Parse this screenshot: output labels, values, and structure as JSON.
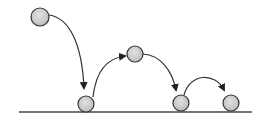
{
  "diagram": {
    "title": "",
    "type": "bouncing-ball-trajectory",
    "colors": {
      "ball_fill": "#cfcfcf",
      "stroke": "#333333",
      "ground": "#444444"
    },
    "ground": {
      "x1": 19,
      "x2": 252,
      "y": 112
    },
    "balls": [
      {
        "id": "ball-1",
        "cx": 40,
        "cy": 17,
        "r": 9
      },
      {
        "id": "ball-2",
        "cx": 86,
        "cy": 104,
        "r": 8
      },
      {
        "id": "ball-3",
        "cx": 135,
        "cy": 54,
        "r": 8
      },
      {
        "id": "ball-4",
        "cx": 181,
        "cy": 103,
        "r": 8
      },
      {
        "id": "ball-5",
        "cx": 231,
        "cy": 103,
        "r": 8
      }
    ],
    "arcs": [
      {
        "id": "arc-1",
        "d": "M49,15 C70,18 82,45 84,88",
        "from": "ball-1",
        "to": "ball-2"
      },
      {
        "id": "arc-2",
        "d": "M93,97 C96,70 108,58 125,56",
        "from": "ball-2",
        "to": "ball-3"
      },
      {
        "id": "arc-3",
        "d": "M143,54 C160,55 172,70 176,90",
        "from": "ball-3",
        "to": "ball-4"
      },
      {
        "id": "arc-4",
        "d": "M184,95 C190,73 215,72 224,90",
        "from": "ball-4",
        "to": "ball-5"
      }
    ]
  }
}
